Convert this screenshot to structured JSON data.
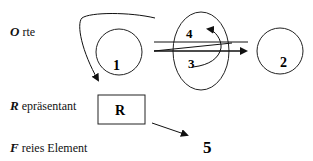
{
  "legend": {
    "orte": {
      "initial": "O",
      "rest": " rte"
    },
    "repraesentant": {
      "initial": "R",
      "rest": " epräsentant"
    },
    "freies_element": {
      "initial": "F",
      "rest": " reies Element"
    }
  },
  "nodes": {
    "circle1": "1",
    "circle2": "2",
    "ellipse_inner_top": "4",
    "ellipse_inner_bottom": "3",
    "box": "R",
    "free": "5"
  }
}
